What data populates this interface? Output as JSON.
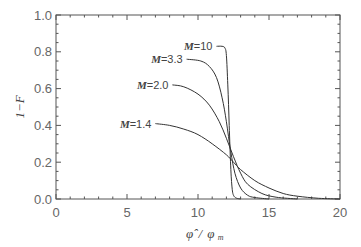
{
  "chart_data": {
    "type": "line",
    "title": "",
    "xlabel": "φ̂/φm",
    "ylabel": "1−F",
    "xlim": [
      0,
      20
    ],
    "ylim": [
      0.0,
      1.0
    ],
    "grid": false,
    "legend_position": "inline labels",
    "x_ticks": [
      0,
      5,
      10,
      15,
      20
    ],
    "x_tick_labels": [
      "0",
      "5",
      "10",
      "15",
      "20"
    ],
    "y_ticks": [
      0.0,
      0.2,
      0.4,
      0.6,
      0.8,
      1.0
    ],
    "y_tick_labels": [
      "0.0",
      "0.2",
      "0.4",
      "0.6",
      "0.8",
      "1.0"
    ],
    "series": [
      {
        "name": "M=10",
        "label": "M=10",
        "x": [
          11.3,
          11.7,
          11.9,
          12.0,
          12.1,
          12.2,
          12.3,
          12.4,
          12.5,
          12.7,
          13.0
        ],
        "y": [
          0.83,
          0.83,
          0.82,
          0.78,
          0.62,
          0.4,
          0.18,
          0.06,
          0.02,
          0.005,
          0.0
        ]
      },
      {
        "name": "M=3.3",
        "label": "M=3.3",
        "x": [
          9.2,
          10.2,
          10.8,
          11.3,
          11.7,
          12.0,
          12.3,
          12.6,
          13.0,
          13.5,
          14.0,
          15.0
        ],
        "y": [
          0.76,
          0.75,
          0.72,
          0.66,
          0.55,
          0.42,
          0.26,
          0.14,
          0.06,
          0.02,
          0.008,
          0.0
        ]
      },
      {
        "name": "M=2.0",
        "label": "M=2.0",
        "x": [
          8.2,
          9.0,
          10.0,
          10.8,
          11.5,
          12.0,
          12.5,
          13.0,
          13.5,
          14.5,
          15.5,
          17.0
        ],
        "y": [
          0.62,
          0.61,
          0.57,
          0.51,
          0.42,
          0.33,
          0.23,
          0.14,
          0.08,
          0.03,
          0.01,
          0.0
        ]
      },
      {
        "name": "M=1.4",
        "label": "M=1.4",
        "x": [
          7.0,
          8.0,
          9.0,
          10.0,
          11.0,
          12.0,
          12.5,
          13.0,
          14.0,
          15.0,
          16.0,
          17.0,
          18.5,
          20.0
        ],
        "y": [
          0.41,
          0.4,
          0.38,
          0.35,
          0.3,
          0.24,
          0.2,
          0.16,
          0.1,
          0.06,
          0.03,
          0.015,
          0.004,
          0.0
        ]
      }
    ],
    "annotations": [
      "M=10",
      "M=3.3",
      "M=2.0",
      "M=1.4"
    ]
  },
  "labels": {
    "x_axis": "φ̂ / φm",
    "x_axis_main": "φ̂",
    "x_axis_sep": "/",
    "x_axis_den": "φ",
    "x_axis_sub": "m",
    "y_axis": "1−F",
    "m_prefix": "M",
    "series_values": [
      "=10",
      "=3.3",
      "=2.0",
      "=1.4"
    ]
  },
  "colors": {
    "line": "#333333",
    "axis": "#555555",
    "text": "#666666"
  }
}
